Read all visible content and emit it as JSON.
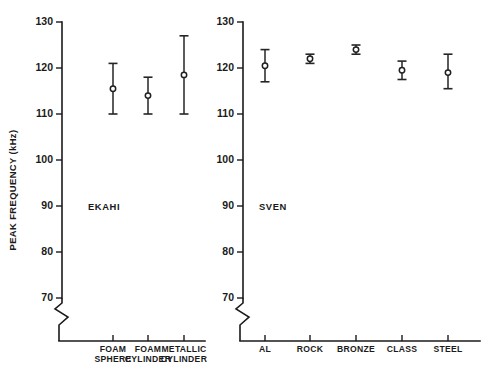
{
  "figure": {
    "background_color": "#ffffff",
    "ink_color": "#1a1a1a",
    "marker_fill_color": "#ffffff",
    "ylabel": "PEAK FREQUENCY (kHz)"
  },
  "chart_data": [
    {
      "type": "scatter",
      "title": "EKAHI",
      "panel": "left",
      "xlabel": "",
      "ylabel": "PEAK FREQUENCY (kHz)",
      "ylim": [
        70,
        130
      ],
      "yticks": [
        70,
        80,
        90,
        100,
        110,
        120,
        130
      ],
      "ytick_labels": [
        "70",
        "80",
        "90",
        "100",
        "110",
        "120",
        "130"
      ],
      "axis_break": true,
      "axis_break_note": "zigzag break on y-axis below 70",
      "grid": false,
      "legend": "none",
      "error_bar_style": "capped vertical range, open circle marker at mean",
      "categories": [
        "FOAM SPHERE",
        "FOAM CYLINDER",
        "METALLIC CYLINDER"
      ],
      "category_labels_wrapped": [
        [
          "FOAM",
          "SPHERE"
        ],
        [
          "FOAM",
          "CYLINDER"
        ],
        [
          "METALLIC",
          "CYLINDER"
        ]
      ],
      "values": [
        115.5,
        114.0,
        118.5
      ],
      "err_low": [
        110.0,
        110.0,
        110.0
      ],
      "err_high": [
        121.0,
        118.0,
        127.0
      ]
    },
    {
      "type": "scatter",
      "title": "SVEN",
      "panel": "right",
      "xlabel": "",
      "ylabel": "",
      "ylim": [
        70,
        130
      ],
      "yticks": [
        70,
        80,
        90,
        100,
        110,
        120,
        130
      ],
      "ytick_labels": [
        "70",
        "80",
        "90",
        "100",
        "110",
        "120",
        "130"
      ],
      "axis_break": true,
      "axis_break_note": "zigzag break on y-axis below 70",
      "grid": false,
      "legend": "none",
      "error_bar_style": "capped vertical range, open circle marker at mean",
      "categories": [
        "AL",
        "ROCK",
        "BRONZE",
        "CLASS",
        "STEEL"
      ],
      "category_labels_wrapped": [
        [
          "AL"
        ],
        [
          "ROCK"
        ],
        [
          "BRONZE"
        ],
        [
          "CLASS"
        ],
        [
          "STEEL"
        ]
      ],
      "values": [
        120.5,
        122.0,
        124.0,
        119.5,
        119.0
      ],
      "err_low": [
        117.0,
        121.0,
        123.0,
        117.5,
        115.5
      ],
      "err_high": [
        124.0,
        123.0,
        125.0,
        121.5,
        123.0
      ]
    }
  ]
}
